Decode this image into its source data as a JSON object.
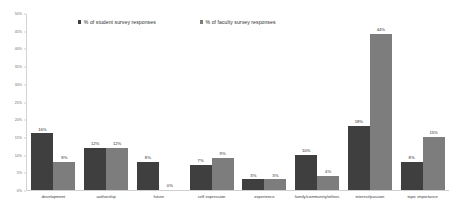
{
  "chart_data": {
    "type": "bar",
    "title": "",
    "xlabel": "",
    "ylabel": "",
    "ylim": [
      0,
      50
    ],
    "ytick_labels": [
      "50%",
      "45%",
      "40%",
      "35%",
      "30%",
      "25%",
      "20%",
      "15%",
      "10%",
      "5%",
      "0%"
    ],
    "ytick_values": [
      50,
      45,
      40,
      35,
      30,
      25,
      20,
      15,
      10,
      5,
      0
    ],
    "grid": false,
    "legend_position": "top",
    "categories": [
      "development",
      "authorship",
      "future",
      "self expression",
      "experience",
      "family/community/others",
      "interest/passion",
      "topic importance"
    ],
    "series": [
      {
        "name": "% of student survey responses",
        "color": "#3f3f3f",
        "values": [
          16,
          12,
          8,
          7,
          3,
          10,
          18,
          8
        ],
        "value_labels": [
          "16%",
          "12%",
          "8%",
          "7%",
          "3%",
          "10%",
          "18%",
          "8%"
        ]
      },
      {
        "name": "% of faculty survey responses",
        "color": "#7d7d7d",
        "values": [
          8,
          12,
          0,
          9,
          3,
          4,
          44,
          15
        ],
        "value_labels": [
          "8%",
          "12%",
          "0%",
          "9%",
          "3%",
          "4%",
          "44%",
          "15%"
        ]
      }
    ]
  },
  "legend": {
    "items": [
      {
        "label": "% of student survey responses",
        "color": "#3f3f3f"
      },
      {
        "label": "% of faculty survey responses",
        "color": "#7d7d7d"
      }
    ]
  }
}
